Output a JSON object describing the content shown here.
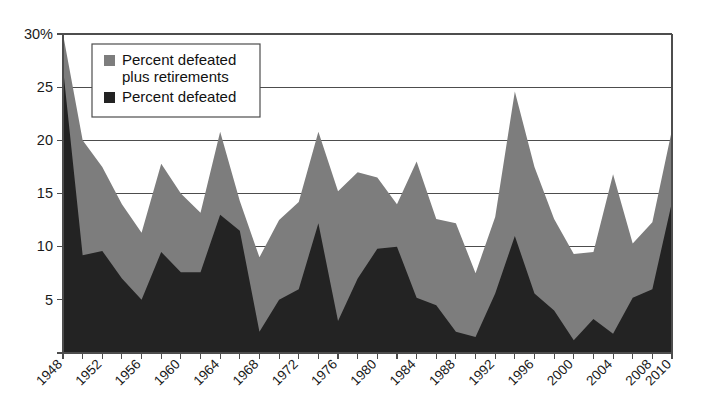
{
  "chart_data": {
    "type": "area",
    "title": "",
    "subtitle": "",
    "xlabel": "",
    "ylabel": "",
    "xlim": [
      1948,
      2010
    ],
    "ylim": [
      0,
      30
    ],
    "grid": true,
    "legend_position": "top-left",
    "y_ticks": [
      0,
      5,
      10,
      15,
      20,
      25,
      30
    ],
    "y_tick_labels": [
      "",
      "5",
      "10",
      "15",
      "20",
      "25",
      "30%"
    ],
    "x_ticks": [
      1948,
      1950,
      1952,
      1954,
      1956,
      1958,
      1960,
      1962,
      1964,
      1966,
      1968,
      1970,
      1972,
      1974,
      1976,
      1978,
      1980,
      1982,
      1984,
      1986,
      1988,
      1990,
      1992,
      1994,
      1996,
      1998,
      2000,
      2002,
      2004,
      2006,
      2008,
      2010
    ],
    "x_tick_labels": [
      "1948",
      "1952",
      "1956",
      "1960",
      "1964",
      "1968",
      "1972",
      "1976",
      "1980",
      "1984",
      "1988",
      "1992",
      "1996",
      "2000",
      "2004",
      "2008",
      "2010"
    ],
    "x_labeled_years": [
      1948,
      1952,
      1956,
      1960,
      1964,
      1968,
      1972,
      1976,
      1980,
      1984,
      1988,
      1992,
      1996,
      2000,
      2004,
      2008,
      2010
    ],
    "x": [
      1948,
      1950,
      1952,
      1954,
      1956,
      1958,
      1960,
      1962,
      1964,
      1966,
      1968,
      1970,
      1972,
      1974,
      1976,
      1978,
      1980,
      1982,
      1984,
      1986,
      1988,
      1990,
      1992,
      1994,
      1996,
      1998,
      2000,
      2002,
      2004,
      2006,
      2008,
      2010
    ],
    "series": [
      {
        "name": "Percent defeated plus retirements",
        "color": "#7d7d7d",
        "values": [
          30.0,
          20.0,
          17.5,
          14.0,
          11.3,
          17.8,
          15.0,
          13.2,
          20.8,
          14.3,
          9.0,
          12.5,
          14.2,
          20.8,
          15.2,
          17.0,
          16.5,
          14.0,
          18.0,
          12.6,
          12.2,
          7.5,
          12.8,
          24.6,
          17.5,
          12.6,
          9.3,
          9.5,
          16.8,
          10.3,
          12.3,
          21.0
        ]
      },
      {
        "name": "Percent defeated",
        "color": "#232323",
        "values": [
          26.8,
          9.2,
          9.6,
          7.0,
          5.0,
          9.5,
          7.6,
          7.6,
          13.0,
          11.5,
          2.0,
          5.0,
          6.0,
          12.2,
          3.0,
          7.0,
          9.8,
          10.0,
          5.2,
          4.5,
          2.0,
          1.5,
          5.6,
          11.0,
          5.6,
          4.0,
          1.2,
          3.2,
          1.8,
          5.2,
          6.0,
          14.2
        ]
      }
    ]
  },
  "legend": {
    "entries": [
      {
        "label_line1": "Percent defeated",
        "label_line2": "plus retirements",
        "swatch_color": "#7d7d7d"
      },
      {
        "label_line1": "Percent defeated",
        "label_line2": "",
        "swatch_color": "#232323"
      }
    ]
  },
  "colors": {
    "gray_series": "#7d7d7d",
    "black_series": "#232323",
    "axis": "#4d4d4d",
    "background": "#ffffff",
    "text": "#1a1a1a"
  }
}
